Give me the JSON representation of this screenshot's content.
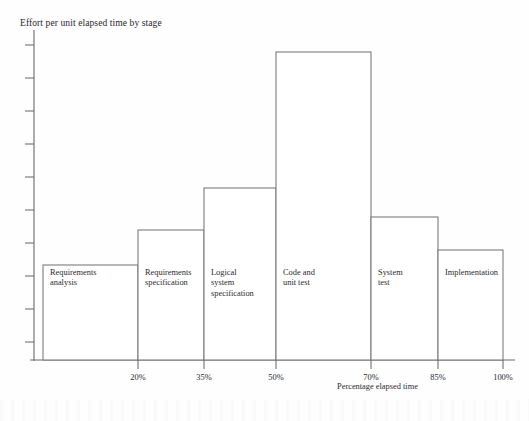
{
  "figure": {
    "title": "Effort per unit elapsed time by stage",
    "x_axis_title": "Percentage elapsed time"
  },
  "chart_data": {
    "type": "bar",
    "title": "Effort per unit elapsed time by stage",
    "xlabel": "Percentage elapsed time",
    "ylabel": "",
    "grid": false,
    "legend": "none",
    "note": "Histogram: bar widths span the elapsed-time interval of each stage; bar height is effort per unit elapsed time (y-axis has unlabeled ticks only).",
    "x_tick_labels": [
      "20%",
      "35%",
      "50%",
      "70%",
      "85%",
      "100%"
    ],
    "x_tick_values": [
      20,
      35,
      50,
      70,
      85,
      100
    ],
    "xlim": [
      5,
      100
    ],
    "ylim": [
      0,
      10
    ],
    "y_tick_count": 10,
    "y_tick_labels": [],
    "categories": [
      "Requirements analysis",
      "Requirements specification",
      "Logical system specification",
      "Code and unit test",
      "System test",
      "Implementation"
    ],
    "values": [
      3.1,
      4.2,
      5.6,
      10.0,
      4.6,
      3.6
    ],
    "bars": [
      {
        "label": "Requirements\nanalysis",
        "label_line1": "Requirements",
        "label_line2": "analysis",
        "x_start": 5,
        "x_end": 20,
        "value": 3.1
      },
      {
        "label": "Requirements\nspecification",
        "label_line1": "Requirements",
        "label_line2": "specification",
        "x_start": 20,
        "x_end": 35,
        "value": 4.2
      },
      {
        "label": "Logical\nsystem\nspecification",
        "label_line1": "Logical",
        "label_line2": "system",
        "label_line3": "specification",
        "x_start": 35,
        "x_end": 50,
        "value": 5.6
      },
      {
        "label": "Code and\nunit test",
        "label_line1": "Code and",
        "label_line2": "unit test",
        "x_start": 50,
        "x_end": 70,
        "value": 10.0
      },
      {
        "label": "System\ntest",
        "label_line1": "System",
        "label_line2": "test",
        "x_start": 70,
        "x_end": 85,
        "value": 4.6
      },
      {
        "label": "Implementation",
        "label_line1": "Implementation",
        "x_start": 85,
        "x_end": 100,
        "value": 3.6
      }
    ]
  },
  "geometry": {
    "axis_x_left": 34,
    "axis_x_right": 515,
    "axis_y_baseline": 360,
    "axis_y_top": 30,
    "bars_px": [
      {
        "x": 43,
        "w": 95,
        "top": 265
      },
      {
        "x": 138,
        "w": 66,
        "top": 230
      },
      {
        "x": 204,
        "w": 72,
        "top": 188
      },
      {
        "x": 276,
        "w": 95,
        "top": 52
      },
      {
        "x": 371,
        "w": 67,
        "top": 217
      },
      {
        "x": 438,
        "w": 65,
        "top": 250
      }
    ],
    "x_ticks_px": [
      138,
      204,
      276,
      371,
      438,
      503
    ],
    "y_ticks_px": [
      45,
      78,
      111,
      144,
      177,
      210,
      243,
      276,
      309,
      342
    ]
  },
  "colors": {
    "ink": "#2a2a2e",
    "line": "#6a6a6c",
    "bar_stroke": "#76767a",
    "bar_fill": "#ffffff",
    "page": "#fefefe"
  }
}
